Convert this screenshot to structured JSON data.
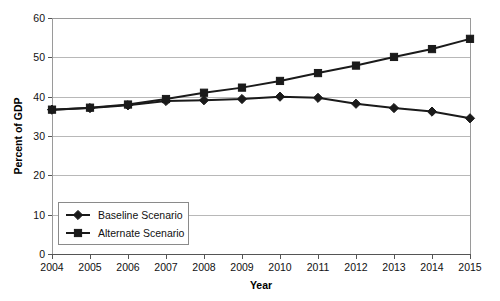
{
  "chart_data": {
    "type": "line",
    "title": "",
    "xlabel": "Year",
    "ylabel": "Percent of GDP",
    "categories": [
      "2004",
      "2005",
      "2006",
      "2007",
      "2008",
      "2009",
      "2010",
      "2011",
      "2012",
      "2013",
      "2014",
      "2015"
    ],
    "x": [
      2004,
      2005,
      2006,
      2007,
      2008,
      2009,
      2010,
      2011,
      2012,
      2013,
      2014,
      2015
    ],
    "xlim": [
      2004,
      2015
    ],
    "ylim": [
      0,
      60
    ],
    "yticks": [
      0,
      10,
      20,
      30,
      40,
      50,
      60
    ],
    "xticks": [
      "2004",
      "2005",
      "2006",
      "2007",
      "2008",
      "2009",
      "2010",
      "2011",
      "2012",
      "2013",
      "2014",
      "2015"
    ],
    "grid": "horizontal",
    "legend_position": "bottom-left",
    "series": [
      {
        "name": "Baseline Scenario",
        "marker": "diamond",
        "color": "#1a1a1a",
        "values": [
          36.7,
          37.1,
          37.8,
          38.9,
          39.1,
          39.4,
          40.0,
          39.7,
          38.2,
          37.1,
          36.2,
          34.5
        ]
      },
      {
        "name": "Alternate Scenario",
        "marker": "square",
        "color": "#1a1a1a",
        "values": [
          36.7,
          37.2,
          38.0,
          39.4,
          41.0,
          42.3,
          44.0,
          46.0,
          47.9,
          50.1,
          52.1,
          54.7
        ]
      }
    ]
  },
  "axis": {
    "y_title": "Percent of GDP",
    "x_title": "Year"
  },
  "legend": {
    "items": [
      {
        "label": "Baseline Scenario",
        "marker": "diamond-marker"
      },
      {
        "label": "Alternate Scenario",
        "marker": "square-marker"
      }
    ]
  }
}
